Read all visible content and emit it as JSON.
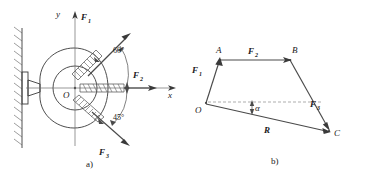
{
  "figure": {
    "panels": [
      {
        "id": "panel-a",
        "caption": "a)",
        "description": "Ring bracket fixed to a wall with three forces applied at point O",
        "origin_label": "O",
        "axis_x_label": "x",
        "axis_y_label": "y",
        "forces": [
          {
            "name": "F",
            "sub": "1",
            "label": "F₁"
          },
          {
            "name": "F",
            "sub": "2",
            "label": "F₂"
          },
          {
            "name": "F",
            "sub": "3",
            "label": "F₃"
          }
        ],
        "angles": [
          {
            "value": "60°",
            "between": "F1-and-F2"
          },
          {
            "value": "45°",
            "between": "F2-and-F3"
          }
        ]
      },
      {
        "id": "panel-b",
        "caption": "b)",
        "description": "Force polygon O-A-B-C with resultant R and angle alpha",
        "vertices": [
          {
            "key": "O",
            "label": "O"
          },
          {
            "key": "A",
            "label": "A"
          },
          {
            "key": "B",
            "label": "B"
          },
          {
            "key": "C",
            "label": "C"
          }
        ],
        "vectors": [
          {
            "name": "F",
            "sub": "1",
            "label": "F₁",
            "from": "O",
            "to": "A"
          },
          {
            "name": "F",
            "sub": "2",
            "label": "F₂",
            "from": "A",
            "to": "B"
          },
          {
            "name": "F",
            "sub": "3",
            "label": "F₃",
            "from": "B",
            "to": "C"
          },
          {
            "name": "R",
            "sub": "",
            "label": "R",
            "from": "O",
            "to": "C"
          }
        ],
        "angle": {
          "symbol": "α",
          "between": "reference-axis-and-R"
        }
      }
    ],
    "colors": {
      "line": "#3a3a3a",
      "hatch": "#5a5a5a",
      "dashed": "#8a8a8a",
      "text": "#202020",
      "background": "#ffffff"
    }
  }
}
